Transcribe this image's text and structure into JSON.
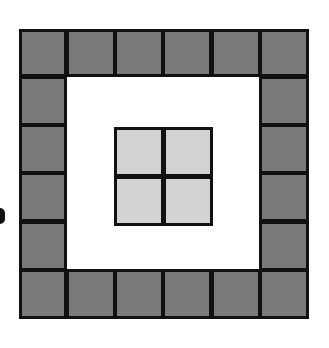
{
  "diagram": {
    "outer_grid": {
      "columns": 6,
      "rows": 6,
      "left": 19,
      "top": 29,
      "cell_size": 48.3,
      "tile_count": 20
    },
    "inner_grid": {
      "columns": 2,
      "rows": 2,
      "left": 114,
      "top": 127,
      "cell_size": 50,
      "tile_count": 4
    },
    "colors": {
      "border": "#111111",
      "dark_tile": "#7a7a7a",
      "light_tile": "#d2d2d2",
      "background": "#ffffff"
    }
  }
}
